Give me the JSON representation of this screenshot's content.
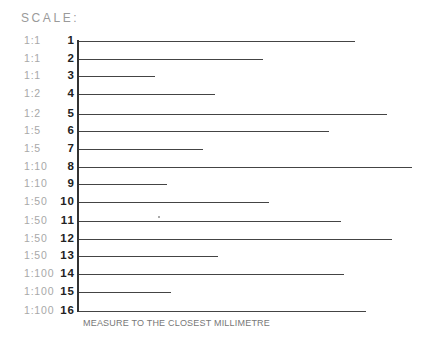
{
  "title": "SCALE:",
  "footer": "MEASURE TO THE CLOSEST MILLIMETRE",
  "rows": [
    {
      "number": "1",
      "scale": "1:1",
      "y": 41,
      "end_x": 355
    },
    {
      "number": "2",
      "scale": "1:1",
      "y": 59,
      "end_x": 263
    },
    {
      "number": "3",
      "scale": "1:1",
      "y": 76,
      "end_x": 155
    },
    {
      "number": "4",
      "scale": "1:2",
      "y": 94,
      "end_x": 215
    },
    {
      "number": "5",
      "scale": "1:2",
      "y": 114,
      "end_x": 387
    },
    {
      "number": "6",
      "scale": "1:5",
      "y": 131,
      "end_x": 329
    },
    {
      "number": "7",
      "scale": "1:5",
      "y": 149,
      "end_x": 203
    },
    {
      "number": "8",
      "scale": "1:10",
      "y": 167,
      "end_x": 412
    },
    {
      "number": "9",
      "scale": "1:10",
      "y": 184,
      "end_x": 167
    },
    {
      "number": "10",
      "scale": "1:50",
      "y": 202,
      "end_x": 269
    },
    {
      "number": "11",
      "scale": "1:50",
      "y": 221,
      "end_x": 341
    },
    {
      "number": "12",
      "scale": "1:50",
      "y": 239,
      "end_x": 392
    },
    {
      "number": "13",
      "scale": "1:50",
      "y": 256,
      "end_x": 218
    },
    {
      "number": "14",
      "scale": "1:100",
      "y": 274,
      "end_x": 344
    },
    {
      "number": "15",
      "scale": "1:100",
      "y": 292,
      "end_x": 171
    },
    {
      "number": "16",
      "scale": "1:100",
      "y": 311,
      "end_x": 366
    }
  ]
}
